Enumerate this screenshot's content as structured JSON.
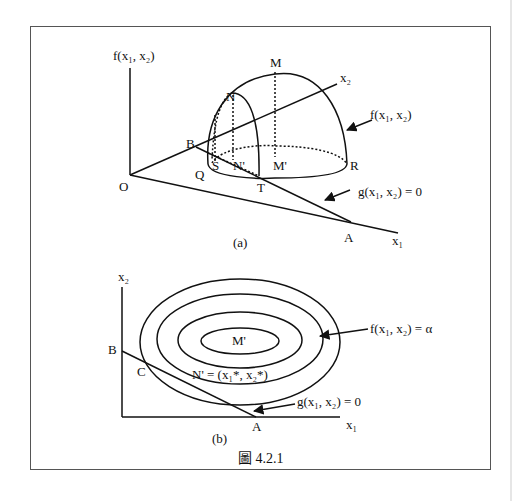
{
  "figure": {
    "caption": "圖 4.2.1",
    "caption_prefix": "圖",
    "caption_number": "4.2.1"
  },
  "panel_a": {
    "label": "(a)",
    "vertical_axis_label": "f(x₁, x₂)",
    "axis_x1_label": "x₁",
    "axis_x2_label": "x₂",
    "origin_label": "O",
    "points": {
      "M": "M",
      "N": "N",
      "M_prime": "M'",
      "N_prime": "N'",
      "S": "S",
      "Q": "Q",
      "T": "T",
      "R": "R",
      "B": "B",
      "A": "A"
    },
    "surface_label": "f(x₁, x₂)",
    "constraint_label": "g(x₁, x₂) = 0"
  },
  "panel_b": {
    "label": "(b)",
    "axis_x1_label": "x₁",
    "axis_x2_label": "x₂",
    "points": {
      "B": "B",
      "A": "A",
      "C": "C",
      "M_prime": "M'"
    },
    "tangent_point_label": "N' = (x₁*, x₂*)",
    "contour_label": "f(x₁, x₂) = α",
    "constraint_label": "g(x₁, x₂) = 0",
    "contour_count": 4
  }
}
